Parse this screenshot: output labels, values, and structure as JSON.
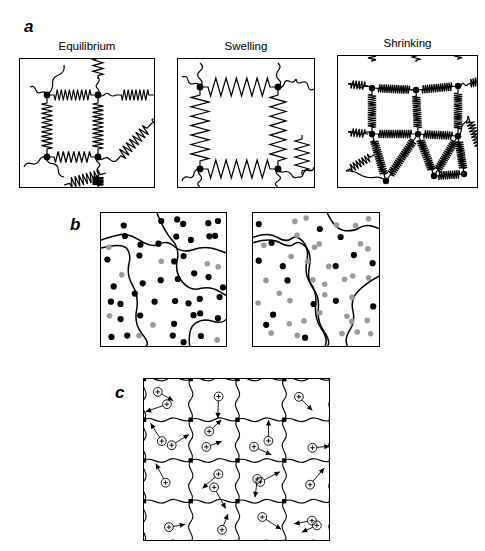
{
  "figure": {
    "caption_present": false,
    "panels": [
      {
        "label": "a",
        "label_pos": {
          "x": 24,
          "y": 18
        },
        "subpanels": [
          {
            "title": "Equilibrium",
            "box": {
              "x": 19,
              "y": 58,
              "w": 136,
              "h": 130
            },
            "state": "equilibrium",
            "node_count": 4,
            "spring_density": "medium",
            "description": "polymer network with crosslink nodes joined by coiled springs at rest length"
          },
          {
            "title": "Swelling",
            "box": {
              "x": 177,
              "y": 58,
              "w": 138,
              "h": 130
            },
            "state": "swelling",
            "node_count": 4,
            "spring_density": "low",
            "description": "network expanded, springs stretched with long wavelength and few coils"
          },
          {
            "title": "Shrinking",
            "box": {
              "x": 337,
              "y": 55,
              "w": 141,
              "h": 133
            },
            "state": "shrinking",
            "node_count": 9,
            "spring_density": "high",
            "description": "network collapsed, springs compressed into dense tight coils"
          }
        ]
      },
      {
        "label": "b",
        "label_pos": {
          "x": 70,
          "y": 216
        },
        "subpanels": [
          {
            "title": "",
            "box": {
              "x": 100,
              "y": 212,
              "w": 127,
              "h": 135
            },
            "state": "black-rich",
            "black_dots": 43,
            "gray_dots": 9,
            "domain_lines": 3,
            "description": "two-phase domain map dominated by black segments with domain boundary curves"
          },
          {
            "title": "",
            "box": {
              "x": 252,
              "y": 212,
              "w": 128,
              "h": 135
            },
            "state": "gray-rich",
            "black_dots": 16,
            "gray_dots": 36,
            "domain_lines": 4,
            "description": "two-phase domain map dominated by gray segments with domain boundary curves"
          }
        ]
      },
      {
        "label": "c",
        "label_pos": {
          "x": 115,
          "y": 384
        },
        "subpanels": [
          {
            "title": "",
            "box": {
              "x": 143,
              "y": 378,
              "w": 187,
              "h": 163
            },
            "state": "ionic-mesh",
            "grid_cols": 4,
            "grid_rows": 4,
            "ion_count": 22,
            "ion_symbol": "+",
            "description": "wavy polymer mesh lattice with crosslink dots and circled positive counter-ions each carrying a motion arrow"
          }
        ]
      }
    ]
  },
  "colors": {
    "ink": "#000000",
    "gray_dot": "#9a9a9a",
    "background": "#ffffff"
  },
  "chart_data": {
    "type": "diagram",
    "title": "",
    "panels": {
      "a": {
        "series": [
          {
            "name": "Equilibrium",
            "nodes": 4,
            "spring_coils_per_strand": 9,
            "relative_mesh_size": 1.0
          },
          {
            "name": "Swelling",
            "nodes": 4,
            "spring_coils_per_strand": 6,
            "relative_mesh_size": 1.45
          },
          {
            "name": "Shrinking",
            "nodes": 9,
            "spring_coils_per_strand": 16,
            "relative_mesh_size": 0.55
          }
        ]
      },
      "b": {
        "categories": [
          "left panel",
          "right panel"
        ],
        "series": [
          {
            "name": "black dots",
            "values": [
              43,
              16
            ]
          },
          {
            "name": "gray dots",
            "values": [
              9,
              36
            ]
          }
        ]
      },
      "c": {
        "grid": [
          4,
          4
        ],
        "ions": 22,
        "ion_charge": "+"
      }
    }
  }
}
